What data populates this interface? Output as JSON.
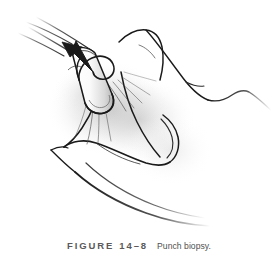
{
  "figure": {
    "label": "FIGURE",
    "number": "14–8",
    "caption": "Punch biopsy.",
    "illustration": {
      "type": "medical-line-art",
      "subject": "punch-biopsy-procedure",
      "description": "Line drawing of a skin punch biopsy: a cylindrical punch instrument is pressed into skin that is stretched between the operator's fingers, with a curved arrow showing the rotating (twisting) motion of the punch.",
      "elements": [
        "punch-instrument",
        "rotation-arrow",
        "skin-surface",
        "stretched-skin-fold",
        "index-finger",
        "thumb",
        "shading-hatching"
      ],
      "line_color": "#1a1a1a",
      "shading_color": "#b9b9b9",
      "background_color": "#ffffff"
    }
  }
}
